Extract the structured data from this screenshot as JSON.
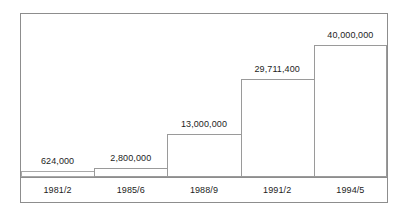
{
  "chart_data": {
    "type": "bar",
    "title": "",
    "subtitle": "",
    "xlabel": "",
    "ylabel": "",
    "grid": false,
    "legend": false,
    "legend_position": "none",
    "categories": [
      "1981/2",
      "1985/6",
      "1988/9",
      "1991/2",
      "1994/5"
    ],
    "values": [
      624000,
      2800000,
      13000000,
      29711400,
      40000000
    ],
    "value_labels": [
      "624,000",
      "2,800,000",
      "13,000,000",
      "29,711,400",
      "40,000,000"
    ],
    "ylim": [
      0,
      40000000
    ],
    "series": [
      {
        "name": "",
        "values": [
          624000,
          2800000,
          13000000,
          29711400,
          40000000
        ]
      }
    ],
    "annotations": []
  },
  "style": {
    "bar_fill": "#ffffff",
    "bar_outline": "#9a9a9a",
    "frame_color": "#8d8d8d",
    "axis_color": "#8d8d8d",
    "text_color": "#1d1d1d",
    "background": "#ffffff"
  }
}
